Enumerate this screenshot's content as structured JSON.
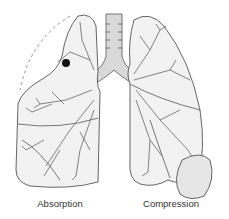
{
  "figure": {
    "labels": {
      "left": "Absorption",
      "right": "Compression"
    },
    "colors": {
      "outline": "#555555",
      "lung_fill": "#f2f2f2",
      "airway_fill": "#d9d9d9",
      "obstruction": "#111111",
      "effusion_fill": "#e6e6e6",
      "dashed_outline": "#777777"
    }
  }
}
